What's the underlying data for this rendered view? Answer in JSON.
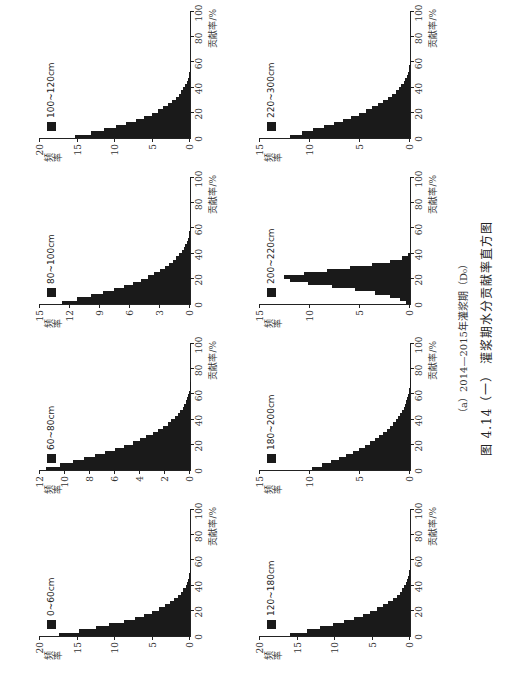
{
  "figure": {
    "subcaption": "（a）2014—2015年灌浆期（D₀）",
    "caption": "图 4.14（一）  灌浆期水分贡献率直方图"
  },
  "chart_data": [
    {
      "type": "bar",
      "title": "0~60cm",
      "legend": "0~60cm",
      "xlabel": "贡献率/%",
      "ylabel": "频率",
      "xlim": [
        0,
        100
      ],
      "ylim": [
        0,
        20
      ],
      "xticks": [
        20,
        40,
        60,
        80,
        100
      ],
      "yticks": [
        0,
        5,
        10,
        15,
        20
      ],
      "bin_width": 2.5,
      "values": [
        17.5,
        14.8,
        12.5,
        10.8,
        8.8,
        7.4,
        6.2,
        5.1,
        4.2,
        3.4,
        2.7,
        2.1,
        1.6,
        1.2,
        0.9,
        0.6,
        0.4,
        0.25,
        0.15,
        0.08,
        0.03
      ]
    },
    {
      "type": "bar",
      "title": "60~80cm",
      "legend": "60~80cm",
      "xlabel": "贡献率/%",
      "ylabel": "频率",
      "xlim": [
        0,
        100
      ],
      "ylim": [
        0,
        12
      ],
      "xticks": [
        20,
        40,
        60,
        80,
        100
      ],
      "yticks": [
        0,
        2,
        4,
        6,
        8,
        10,
        12
      ],
      "bin_width": 2.5,
      "values": [
        11.5,
        10.4,
        9.4,
        8.5,
        7.6,
        6.8,
        6.0,
        5.3,
        4.6,
        4.0,
        3.5,
        3.0,
        2.6,
        2.2,
        1.8,
        1.5,
        1.2,
        1.0,
        0.8,
        0.6,
        0.45,
        0.32,
        0.22,
        0.14,
        0.08,
        0.04,
        0.02,
        0.01
      ]
    },
    {
      "type": "bar",
      "title": "80~100cm",
      "legend": "80~100cm",
      "xlabel": "贡献率/%",
      "ylabel": "频率",
      "xlim": [
        0,
        100
      ],
      "ylim": [
        0,
        15
      ],
      "xticks": [
        20,
        40,
        60,
        80,
        100
      ],
      "yticks": [
        0,
        3,
        6,
        9,
        12,
        15
      ],
      "bin_width": 2.5,
      "values": [
        12.8,
        11.3,
        9.9,
        8.7,
        7.6,
        6.6,
        5.7,
        4.9,
        4.2,
        3.6,
        3.0,
        2.5,
        2.1,
        1.7,
        1.4,
        1.1,
        0.85,
        0.65,
        0.48,
        0.34,
        0.23,
        0.14,
        0.08,
        0.04,
        0.02
      ]
    },
    {
      "type": "bar",
      "title": "100~120cm",
      "legend": "100~120cm",
      "xlabel": "贡献率/%",
      "ylabel": "频率",
      "xlim": [
        0,
        100
      ],
      "ylim": [
        0,
        20
      ],
      "xticks": [
        20,
        40,
        60,
        80,
        100
      ],
      "yticks": [
        0,
        5,
        10,
        15,
        20
      ],
      "bin_width": 2.5,
      "values": [
        15.3,
        13.2,
        11.5,
        9.9,
        8.5,
        7.2,
        6.1,
        5.1,
        4.3,
        3.6,
        2.9,
        2.4,
        1.9,
        1.5,
        1.2,
        0.9,
        0.65,
        0.45,
        0.3,
        0.18,
        0.1,
        0.05,
        0.02
      ]
    },
    {
      "type": "bar",
      "title": "120~180cm",
      "legend": "120~180cm",
      "xlabel": "贡献率/%",
      "ylabel": "频率",
      "xlim": [
        0,
        100
      ],
      "ylim": [
        0,
        20
      ],
      "xticks": [
        20,
        40,
        60,
        80,
        100
      ],
      "yticks": [
        0,
        5,
        10,
        15,
        20
      ],
      "bin_width": 2.5,
      "values": [
        16.0,
        13.8,
        12.0,
        10.3,
        8.8,
        7.5,
        6.3,
        5.3,
        4.4,
        3.6,
        2.9,
        2.3,
        1.8,
        1.4,
        1.05,
        0.78,
        0.55,
        0.38,
        0.24,
        0.14,
        0.07,
        0.03
      ]
    },
    {
      "type": "bar",
      "title": "180~200cm",
      "legend": "180~200cm",
      "xlabel": "贡献率/%",
      "ylabel": "频率",
      "xlim": [
        0,
        100
      ],
      "ylim": [
        0,
        15
      ],
      "xticks": [
        20,
        40,
        60,
        80,
        100
      ],
      "yticks": [
        0,
        5,
        10,
        15
      ],
      "bin_width": 2.5,
      "values": [
        9.8,
        8.8,
        7.9,
        7.1,
        6.4,
        5.7,
        5.1,
        4.5,
        4.0,
        3.5,
        3.1,
        2.7,
        2.3,
        2.0,
        1.7,
        1.4,
        1.2,
        1.0,
        0.8,
        0.62,
        0.48,
        0.36,
        0.26,
        0.18,
        0.12,
        0.07,
        0.04,
        0.02,
        0.01
      ]
    },
    {
      "type": "bar",
      "title": "200~220cm",
      "legend": "200~220cm",
      "xlabel": "贡献率/%",
      "ylabel": "频率",
      "xlim": [
        0,
        100
      ],
      "ylim": [
        0,
        15
      ],
      "xticks": [
        20,
        40,
        60,
        80,
        100
      ],
      "yticks": [
        0,
        5,
        10,
        15
      ],
      "bin_width": 2.5,
      "values": [
        0.4,
        1.0,
        2.0,
        3.5,
        5.5,
        7.8,
        10.2,
        12.0,
        12.6,
        10.6,
        8.3,
        6.0,
        3.8,
        2.0,
        0.8,
        0.2
      ]
    },
    {
      "type": "bar",
      "title": "220~300cm",
      "legend": "220~300cm",
      "xlabel": "贡献率/%",
      "ylabel": "频率",
      "xlim": [
        0,
        100
      ],
      "ylim": [
        0,
        15
      ],
      "xticks": [
        20,
        40,
        60,
        80,
        100
      ],
      "yticks": [
        0,
        5,
        10,
        15
      ],
      "bin_width": 2.5,
      "values": [
        12.0,
        10.8,
        9.7,
        8.6,
        7.6,
        6.7,
        5.9,
        5.1,
        4.4,
        3.8,
        3.2,
        2.7,
        2.2,
        1.8,
        1.45,
        1.15,
        0.88,
        0.65,
        0.47,
        0.32,
        0.2,
        0.12,
        0.06,
        0.03
      ]
    }
  ]
}
